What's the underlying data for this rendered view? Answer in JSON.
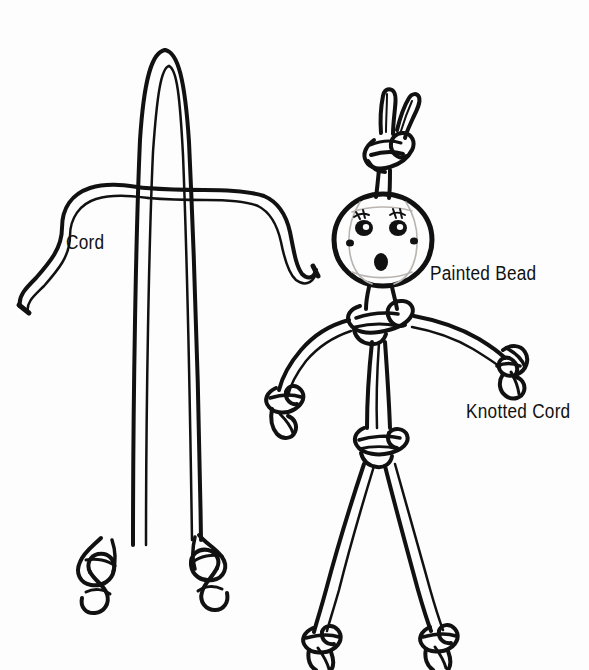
{
  "figure": {
    "background_color": "#fdfdfd",
    "ink_color": "#111111",
    "style": "black-and-white line illustration"
  },
  "labels": {
    "cord": "Cord",
    "painted_bead": "Painted Bead",
    "knotted_cord": "Knotted Cord"
  },
  "diagrams": [
    {
      "name": "step-1-cords",
      "description": "A cord folded into a bight crossed by a second horizontal cord",
      "parts": [
        "folded-cord-bight",
        "horizontal-cord",
        "overhand-knot-left-end",
        "overhand-knot-right-end"
      ]
    },
    {
      "name": "step-2-doll",
      "description": "Finished cord doll with painted bead head, knotted arms and legs",
      "parts": [
        "top-knot",
        "cord-tails-above-head",
        "painted-bead-head",
        "bead-face",
        "neck-knot",
        "left-arm",
        "right-arm",
        "left-hand-knot",
        "right-hand-knot",
        "torso",
        "waist-knot",
        "left-leg",
        "right-leg",
        "left-foot-knot",
        "right-foot-knot"
      ]
    }
  ],
  "bead_face": {
    "features": [
      "left-eye",
      "right-eye",
      "mouth",
      "left-cheek-dot",
      "right-cheek-dot",
      "eyelashes"
    ]
  }
}
